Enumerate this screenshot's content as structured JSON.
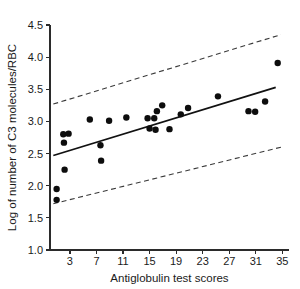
{
  "chart_data": {
    "type": "scatter",
    "title": "",
    "xlabel": "Antiglobulin test scores",
    "ylabel": "Log of number of C3 molecules/RBC",
    "xlim": [
      0,
      36
    ],
    "ylim": [
      1.0,
      4.5
    ],
    "xticks": [
      3,
      7,
      11,
      15,
      19,
      23,
      27,
      31,
      35
    ],
    "xtick_labels": [
      "3",
      "7",
      "11",
      "15",
      "19",
      "23",
      "27",
      "31",
      "35"
    ],
    "yticks": [
      1.0,
      1.5,
      2.0,
      2.5,
      3.0,
      3.5,
      4.0,
      4.5
    ],
    "ytick_labels": [
      "1.0",
      "1.5",
      "2.0",
      "2.5",
      "3.0",
      "3.5",
      "4.0",
      "4.5"
    ],
    "grid": false,
    "legend": false,
    "points": [
      {
        "x": 1.0,
        "y": 1.95
      },
      {
        "x": 1.0,
        "y": 1.78
      },
      {
        "x": 2.2,
        "y": 2.25
      },
      {
        "x": 2.0,
        "y": 2.8
      },
      {
        "x": 2.8,
        "y": 2.81
      },
      {
        "x": 2.1,
        "y": 2.67
      },
      {
        "x": 6.0,
        "y": 3.03
      },
      {
        "x": 7.6,
        "y": 2.63
      },
      {
        "x": 7.7,
        "y": 2.39
      },
      {
        "x": 8.9,
        "y": 3.01
      },
      {
        "x": 11.5,
        "y": 3.06
      },
      {
        "x": 14.7,
        "y": 3.05
      },
      {
        "x": 15.0,
        "y": 2.89
      },
      {
        "x": 15.7,
        "y": 3.05
      },
      {
        "x": 15.9,
        "y": 2.87
      },
      {
        "x": 16.1,
        "y": 3.16
      },
      {
        "x": 16.9,
        "y": 3.25
      },
      {
        "x": 18.0,
        "y": 2.88
      },
      {
        "x": 19.7,
        "y": 3.11
      },
      {
        "x": 20.8,
        "y": 3.21
      },
      {
        "x": 25.3,
        "y": 3.39
      },
      {
        "x": 29.9,
        "y": 3.16
      },
      {
        "x": 30.9,
        "y": 3.15
      },
      {
        "x": 32.4,
        "y": 3.31
      },
      {
        "x": 34.3,
        "y": 3.91
      }
    ],
    "fit_line": {
      "name": "regression line",
      "style": "solid",
      "x_start": 0.5,
      "y_start": 2.47,
      "x_end": 34.0,
      "y_end": 3.53
    },
    "confidence_bands": [
      {
        "name": "upper confidence band",
        "style": "dashed",
        "x_start": 0.5,
        "y_start": 3.27,
        "x_end": 34.8,
        "y_end": 4.35
      },
      {
        "name": "lower confidence band",
        "style": "dashed",
        "x_start": 0.5,
        "y_start": 1.72,
        "x_end": 34.8,
        "y_end": 2.6
      }
    ],
    "colors": {
      "point": "#0d0d0d",
      "fit_line": "#111111",
      "band": "#3a3a3a",
      "axis": "#2b2b2b",
      "text": "#1a1a1a",
      "background": "#ffffff"
    }
  }
}
